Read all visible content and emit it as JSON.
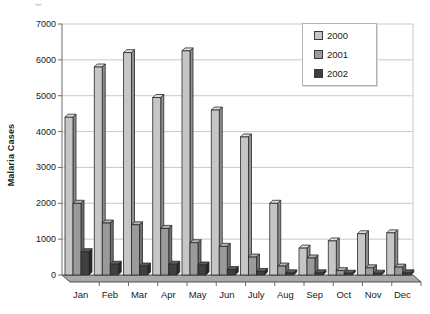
{
  "chart_data": {
    "type": "bar",
    "title": "",
    "xlabel": "",
    "ylabel": "Malaria Cases",
    "categories": [
      "Jan",
      "Feb",
      "Mar",
      "Apr",
      "May",
      "Jun",
      "July",
      "Aug",
      "Sep",
      "Oct",
      "Nov",
      "Dec"
    ],
    "series": [
      {
        "name": "2000",
        "color": "#c6c6c6",
        "top_color": "#dedede",
        "side_color": "#8f8f8f",
        "values": [
          4400,
          5800,
          6200,
          4950,
          6250,
          4600,
          3850,
          2000,
          750,
          950,
          1150,
          1175
        ]
      },
      {
        "name": "2001",
        "color": "#9a9a9a",
        "top_color": "#b4b4b4",
        "side_color": "#6f6f6f",
        "values": [
          2000,
          1450,
          1400,
          1300,
          900,
          800,
          500,
          250,
          475,
          120,
          200,
          220
        ]
      },
      {
        "name": "2002",
        "color": "#3f3f3f",
        "top_color": "#5c5c5c",
        "side_color": "#262626",
        "values": [
          650,
          300,
          250,
          300,
          280,
          150,
          100,
          60,
          60,
          50,
          50,
          60
        ]
      }
    ],
    "ylim": [
      0,
      7000
    ],
    "ytick_step": 1000,
    "grid": "horizontal",
    "legend_position": "top-right",
    "colors": {
      "gridline": "#c9c9c9",
      "axis": "#6b6b6b",
      "outline": "#2a2a2a",
      "floor": "#a9a9a9",
      "text": "#1a1a1a",
      "background": "#ffffff"
    }
  }
}
